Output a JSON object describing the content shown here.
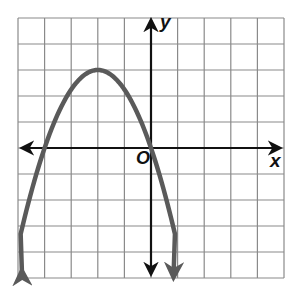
{
  "chart_data": {
    "type": "line",
    "title": "",
    "xlabel": "x",
    "ylabel": "y",
    "origin_label": "O",
    "xlim": [
      -5,
      5
    ],
    "ylim": [
      -5,
      5
    ],
    "grid": true,
    "grid_step": 1,
    "tick_labels_shown": false,
    "series": [
      {
        "name": "parabola",
        "equation": "y = -0.75(x + 2)^2 + 3",
        "vertex": [
          -2,
          3
        ],
        "x_intercepts": [
          -4,
          0
        ],
        "x": [
          -4.9,
          -4,
          -3,
          -2,
          -1,
          0,
          0.9
        ],
        "y": [
          -3.3,
          0,
          2.25,
          3,
          2.25,
          0,
          -3.3
        ],
        "arrows_at_ends": true,
        "color": "#5a5a5a"
      }
    ]
  },
  "colors": {
    "grid": "#8a8a8a",
    "axis": "#111111",
    "curve": "#5a5a5a",
    "background": "#ffffff"
  }
}
